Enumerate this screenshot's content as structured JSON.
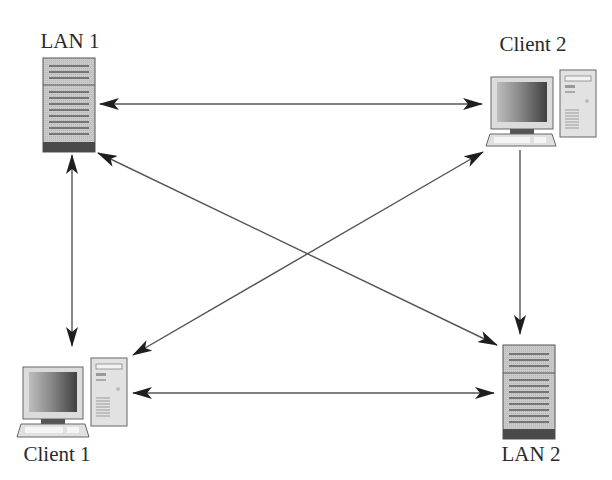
{
  "diagram": {
    "type": "network-topology",
    "colors": {
      "line": "#555555",
      "arrowhead": "#1e1e1e",
      "server_body": "#c8c8c8",
      "server_stripe": "#5a5a5a",
      "server_base": "#4a4a4a",
      "monitor_frame": "#d8d8d8",
      "screen_dark": "#4a4a4a",
      "screen_light": "#b5b5b5",
      "tower_body": "#e2e2e2"
    },
    "nodes": [
      {
        "id": "lan1",
        "label": "LAN 1",
        "kind": "server"
      },
      {
        "id": "client2",
        "label": "Client 2",
        "kind": "workstation"
      },
      {
        "id": "client1",
        "label": "Client 1",
        "kind": "workstation"
      },
      {
        "id": "lan2",
        "label": "LAN 2",
        "kind": "server"
      }
    ],
    "edges": [
      {
        "from": "lan1",
        "to": "client2",
        "direction": "bidirectional"
      },
      {
        "from": "lan1",
        "to": "client1",
        "direction": "bidirectional"
      },
      {
        "from": "lan1",
        "to": "lan2",
        "direction": "bidirectional"
      },
      {
        "from": "client2",
        "to": "client1",
        "direction": "bidirectional"
      },
      {
        "from": "client2",
        "to": "lan2",
        "direction": "one-way"
      },
      {
        "from": "client1",
        "to": "lan2",
        "direction": "bidirectional"
      }
    ]
  },
  "labels": {
    "lan1": "LAN 1",
    "client2": "Client 2",
    "client1": "Client 1",
    "lan2": "LAN 2"
  }
}
